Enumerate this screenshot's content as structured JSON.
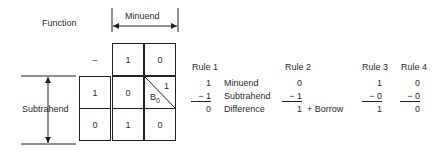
{
  "diagram": {
    "function_label": "Function",
    "minuend_label": "Minuend",
    "subtrahend_label": "Subtrahend",
    "table": {
      "corner": "–",
      "col_headers": [
        "1",
        "0"
      ],
      "row_headers": [
        "1",
        "0"
      ],
      "cells": [
        [
          "0",
          {
            "top_right": "1",
            "bottom_left": "B",
            "subscript": "0"
          }
        ],
        [
          "1",
          "0"
        ]
      ]
    }
  },
  "rules": {
    "row_labels": [
      "Minuend",
      "Subtrahend",
      "Difference"
    ],
    "items": [
      {
        "title": "Rule 1",
        "minuend": "1",
        "subtrahend": "− 1",
        "difference": "0"
      },
      {
        "title": "Rule 2",
        "minuend": "0",
        "subtrahend": "− 1",
        "difference": "1",
        "note": "+ Borrow"
      },
      {
        "title": "Rule 3",
        "minuend": "1",
        "subtrahend": "− 0",
        "difference": "1"
      },
      {
        "title": "Rule 4",
        "minuend": "0",
        "subtrahend": "− 0",
        "difference": "0"
      }
    ]
  }
}
